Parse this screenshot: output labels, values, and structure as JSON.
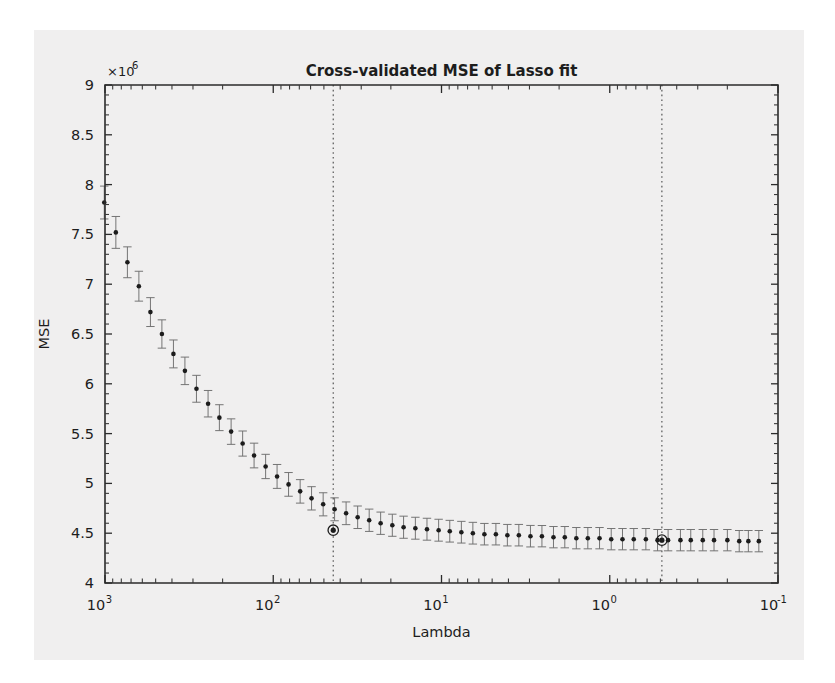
{
  "figure": {
    "background_color": "#f0efef",
    "page_color": "#ffffff",
    "axes_color": "#2b2b2b"
  },
  "chart_data": {
    "type": "line",
    "title": "Cross-validated MSE of Lasso fit",
    "xlabel": "Lambda",
    "ylabel": "MSE",
    "y_exponent_label": "×10",
    "y_exponent_power": "6",
    "y_scale": "linear",
    "y_unit_multiplier": 1000000,
    "ylim": [
      4,
      9
    ],
    "yticks": [
      4,
      4.5,
      5,
      5.5,
      6,
      6.5,
      7,
      7.5,
      8,
      8.5,
      9
    ],
    "ytick_labels": [
      "4",
      "4.5",
      "5",
      "5.5",
      "6",
      "6.5",
      "7",
      "7.5",
      "8",
      "8.5",
      "9"
    ],
    "x_scale": "log",
    "x_reversed": true,
    "xlim": [
      1000,
      0.1
    ],
    "xticks": [
      1000,
      100,
      10,
      1,
      0.1
    ],
    "xtick_labels": [
      "10",
      "10",
      "10",
      "10",
      "10"
    ],
    "xtick_exponents": [
      "3",
      "2",
      "1",
      "0",
      "-1"
    ],
    "grid": false,
    "legend": null,
    "annotations": [
      {
        "name": "lambda-min-mse-line",
        "x": 44.0,
        "style": "dotted-vertical"
      },
      {
        "name": "lambda-1se-line",
        "x": 0.49,
        "style": "dotted-vertical"
      }
    ],
    "highlighted_points": [
      {
        "name": "min-mse-point",
        "x": 44.0,
        "y": 4.53,
        "marker": "circled-dot"
      },
      {
        "name": "one-se-point",
        "x": 0.49,
        "y": 4.43,
        "marker": "circled-dot"
      }
    ],
    "series": [
      {
        "name": "Cross-validated MSE",
        "marker": "filled-circle-with-errorbar",
        "x": [
          1380,
          1180,
          1010,
          862,
          736,
          629,
          537,
          459,
          392,
          335,
          286,
          244,
          209,
          178,
          152,
          130,
          111,
          94.9,
          81.1,
          69.2,
          59.2,
          50.5,
          43.2,
          36.9,
          31.5,
          26.9,
          23.0,
          19.6,
          16.8,
          14.3,
          12.2,
          10.4,
          8.93,
          7.62,
          6.51,
          5.56,
          4.75,
          4.06,
          3.47,
          2.96,
          2.53,
          2.16,
          1.85,
          1.58,
          1.35,
          1.15,
          0.98,
          0.84,
          0.72,
          0.61,
          0.52,
          0.45,
          0.38,
          0.33,
          0.28,
          0.24,
          0.2,
          0.17,
          0.15,
          0.13
        ],
        "y": [
          8.55,
          8.18,
          7.82,
          7.52,
          7.22,
          6.98,
          6.72,
          6.5,
          6.3,
          6.13,
          5.95,
          5.8,
          5.66,
          5.52,
          5.4,
          5.28,
          5.17,
          5.07,
          4.99,
          4.92,
          4.85,
          4.79,
          4.74,
          4.7,
          4.66,
          4.63,
          4.6,
          4.58,
          4.56,
          4.55,
          4.54,
          4.53,
          4.52,
          4.51,
          4.5,
          4.49,
          4.49,
          4.48,
          4.48,
          4.47,
          4.47,
          4.46,
          4.46,
          4.45,
          4.45,
          4.45,
          4.44,
          4.44,
          4.44,
          4.44,
          4.43,
          4.43,
          4.43,
          4.43,
          4.43,
          4.43,
          4.43,
          4.42,
          4.42,
          4.42
        ],
        "yerr": [
          0.175,
          0.17,
          0.165,
          0.16,
          0.155,
          0.15,
          0.145,
          0.142,
          0.14,
          0.138,
          0.135,
          0.133,
          0.13,
          0.128,
          0.126,
          0.124,
          0.122,
          0.12,
          0.119,
          0.118,
          0.117,
          0.116,
          0.115,
          0.114,
          0.113,
          0.112,
          0.112,
          0.111,
          0.111,
          0.11,
          0.11,
          0.11,
          0.109,
          0.109,
          0.109,
          0.108,
          0.108,
          0.108,
          0.108,
          0.108,
          0.107,
          0.107,
          0.107,
          0.107,
          0.107,
          0.107,
          0.107,
          0.107,
          0.107,
          0.107,
          0.107,
          0.107,
          0.107,
          0.107,
          0.107,
          0.107,
          0.107,
          0.107,
          0.107,
          0.107
        ]
      }
    ]
  }
}
